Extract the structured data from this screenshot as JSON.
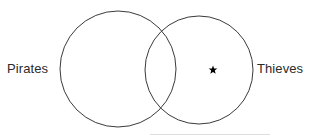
{
  "diagram": {
    "type": "venn-two-set",
    "background_color": "#ffffff",
    "stroke_color": "#3a3a3a",
    "stroke_width": 1,
    "text_color": "#2b2b2b",
    "left_set": {
      "label": "Pirates",
      "cx": 118,
      "cy": 69,
      "r": 58
    },
    "right_set": {
      "label": "Thieves",
      "cx": 199,
      "cy": 70,
      "r": 54
    },
    "markers": [
      {
        "glyph": "star",
        "region": "right-only",
        "x": 213,
        "y": 70,
        "size": 9,
        "color": "#000000"
      }
    ]
  }
}
